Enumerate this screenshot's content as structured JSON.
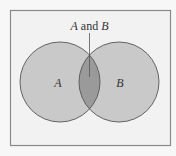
{
  "diagram": {
    "type": "venn",
    "sets": [
      {
        "id": "A",
        "label": "A"
      },
      {
        "id": "B",
        "label": "B"
      }
    ],
    "intersection": {
      "label_part1": "A",
      "label_part2": " and ",
      "label_part3": "B"
    },
    "colors": {
      "background": "#f7f7f7",
      "frame_fill": "#f2f2f2",
      "frame_stroke": "#8a8a8a",
      "circle_fill": "#c9c9c9",
      "circle_stroke": "#555555",
      "intersection_fill": "#9a9a9a",
      "text": "#333333"
    }
  }
}
